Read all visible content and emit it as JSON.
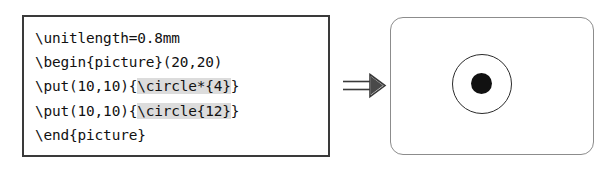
{
  "figure": {
    "kind": "latex-picture-example",
    "relation_symbol": "⟹",
    "relation_icon_name": "double-right-arrow-icon"
  },
  "code_panel": {
    "language": "latex",
    "highlight_color": "#dcdcdc",
    "text_color": "#111111",
    "border_color": "#3a3a3a",
    "background": "#ffffff",
    "lines": [
      {
        "id": "line-1",
        "segments": [
          {
            "text": "\\unitlength=0.8mm",
            "highlight": false
          }
        ]
      },
      {
        "id": "line-2",
        "segments": [
          {
            "text": "\\begin{picture}(20,20)",
            "highlight": false
          }
        ]
      },
      {
        "id": "line-3",
        "segments": [
          {
            "text": "\\put(10,10){",
            "highlight": false
          },
          {
            "text": "\\circle*{4}",
            "highlight": true
          },
          {
            "text": "}",
            "highlight": false
          }
        ]
      },
      {
        "id": "line-4",
        "segments": [
          {
            "text": "\\put(10,10){",
            "highlight": false
          },
          {
            "text": "\\circle{12}",
            "highlight": true
          },
          {
            "text": "}",
            "highlight": false
          }
        ]
      },
      {
        "id": "line-5",
        "segments": [
          {
            "text": "\\end{picture}",
            "highlight": false
          }
        ]
      }
    ]
  },
  "output_panel": {
    "border_color": "#8c8c8c",
    "background": "#ffffff",
    "corner_radius": 13,
    "shapes": [
      {
        "name": "outline-circle",
        "source_command": "\\circle{12}",
        "diameter_units": 12,
        "filled": false,
        "stroke_color": "#2b2b2b",
        "center_units": [
          10,
          10
        ]
      },
      {
        "name": "filled-disk",
        "source_command": "\\circle*{4}",
        "diameter_units": 4,
        "filled": true,
        "fill_color": "#111111",
        "center_units": [
          10,
          10
        ]
      }
    ]
  }
}
